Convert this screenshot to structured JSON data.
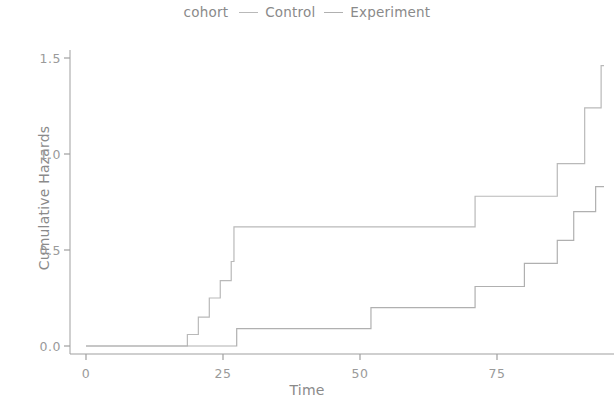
{
  "chart_data": {
    "type": "line",
    "subtype": "step",
    "title": "",
    "xlabel": "Time",
    "ylabel": "Cumulative Hazards",
    "legend_title": "cohort",
    "legend_position": "top-center",
    "grid": false,
    "xlim": [
      -2,
      96
    ],
    "ylim": [
      -0.05,
      1.55
    ],
    "xticks": [
      0,
      25,
      50,
      75
    ],
    "yticks": [
      "0.0",
      "0.5",
      "1.0",
      "1.5"
    ],
    "ytick_values": [
      0.0,
      0.5,
      1.0,
      1.5
    ],
    "series": [
      {
        "name": "Control",
        "color": "#b9b9b9",
        "x": [
          0,
          17,
          18.5,
          20.5,
          22.5,
          24.5,
          26.5,
          27,
          52,
          71,
          86,
          91,
          94
        ],
        "y": [
          0.0,
          0.0,
          0.06,
          0.15,
          0.25,
          0.34,
          0.44,
          0.62,
          0.62,
          0.78,
          0.95,
          1.24,
          1.46
        ],
        "final_value": 1.46
      },
      {
        "name": "Experiment",
        "color": "#b0b0b0",
        "x": [
          0,
          26,
          27.5,
          41,
          52,
          59,
          71,
          80,
          83,
          86,
          89,
          93
        ],
        "y": [
          0.0,
          0.0,
          0.09,
          0.09,
          0.2,
          0.2,
          0.31,
          0.43,
          0.43,
          0.55,
          0.7,
          0.83
        ],
        "final_value": 0.83
      }
    ]
  },
  "legend": {
    "title": "cohort",
    "items": [
      {
        "label": "Control"
      },
      {
        "label": "Experiment"
      }
    ]
  },
  "axes": {
    "x_title": "Time",
    "y_title": "Cumulative Hazards",
    "x_tick_labels": [
      "0",
      "25",
      "50",
      "75"
    ],
    "y_tick_labels": [
      "0.0",
      "0.5",
      "1.0",
      "1.5"
    ]
  },
  "colors": {
    "control": "#b9b9b9",
    "experiment": "#b0b0b0",
    "axis": "#9f9f9f",
    "text": "#8a8a8a",
    "background": "#ffffff"
  }
}
